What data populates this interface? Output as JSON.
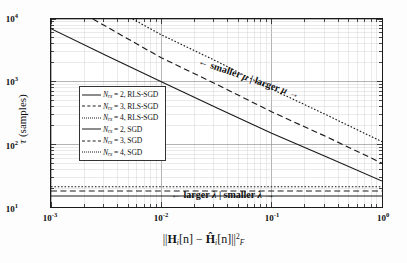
{
  "chart_data": {
    "type": "line",
    "title": "",
    "xlabel": "||H_i[n] - Ĥ_i[n]||^2_F",
    "ylabel": "τ (samples)",
    "xscale": "log",
    "yscale": "log",
    "xlim": [
      0.001,
      1.0
    ],
    "ylim": [
      10,
      10000
    ],
    "xticks": [
      "10-3",
      "10-2",
      "10-1",
      "100"
    ],
    "xtick_exponents": [
      "-3",
      "-2",
      "-1",
      "0"
    ],
    "ytick_exponents": [
      "4",
      "3",
      "2",
      "1"
    ],
    "grid": true,
    "legend_position": "center-left",
    "annotations": [
      {
        "id": "mu-annotation",
        "text": "← smaller μ | larger μ →",
        "rotation": 19
      },
      {
        "id": "lambda-annotation",
        "text": "← larger λ | smaller λ →",
        "rotation": 0
      }
    ],
    "series": [
      {
        "name": "Nrx = 2, RLS-SGD",
        "style": "solid",
        "x": [
          0.001,
          0.01,
          0.1,
          1.0
        ],
        "y": [
          15,
          15,
          15,
          15
        ]
      },
      {
        "name": "Nrx = 3, RLS-SGD",
        "style": "dashed",
        "x": [
          0.001,
          0.01,
          0.1,
          1.0
        ],
        "y": [
          18,
          18,
          18,
          18
        ]
      },
      {
        "name": "Nrx = 4, RLS-SGD",
        "style": "dotted",
        "x": [
          0.001,
          0.01,
          0.1,
          1.0
        ],
        "y": [
          21,
          21,
          21,
          21
        ]
      },
      {
        "name": "Nrx = 2, SGD",
        "style": "solid",
        "x": [
          0.001,
          0.0032,
          0.01,
          0.032,
          0.1,
          0.32,
          1.0
        ],
        "y": [
          7000,
          2600,
          1000,
          380,
          150,
          62,
          26
        ]
      },
      {
        "name": "Nrx = 3, SGD",
        "style": "dashed",
        "x": [
          0.0024,
          0.01,
          0.032,
          0.1,
          0.32,
          1.0
        ],
        "y": [
          10000,
          2400,
          900,
          330,
          130,
          50
        ]
      },
      {
        "name": "Nrx = 4, SGD",
        "style": "dotted",
        "x": [
          0.0055,
          0.01,
          0.032,
          0.1,
          0.32,
          1.0
        ],
        "y": [
          10000,
          5600,
          2100,
          760,
          290,
          110
        ]
      }
    ]
  },
  "axis": {
    "ylabel_tau": "τ",
    "ylabel_unit": "(samples)",
    "xlabel_norm_open": "||",
    "xlabel_H": "H",
    "xlabel_i": "i",
    "xlabel_n": "[n]",
    "xlabel_minus": "−",
    "xlabel_Hhat": "Ĥ",
    "xlabel_close": "||",
    "xlabel_pow": "2",
    "xlabel_F": "F"
  },
  "legend": {
    "items": [
      {
        "label_prefix": "N",
        "label_sub": "rx",
        "label_rest": " = 2, RLS-SGD",
        "style": "solid"
      },
      {
        "label_prefix": "N",
        "label_sub": "rx",
        "label_rest": " = 3, RLS-SGD",
        "style": "dashed"
      },
      {
        "label_prefix": "N",
        "label_sub": "rx",
        "label_rest": " = 4, RLS-SGD",
        "style": "dotted"
      },
      {
        "label_prefix": "N",
        "label_sub": "rx",
        "label_rest": " = 2, SGD",
        "style": "solid"
      },
      {
        "label_prefix": "N",
        "label_sub": "rx",
        "label_rest": " = 3, SGD",
        "style": "dashed"
      },
      {
        "label_prefix": "N",
        "label_sub": "rx",
        "label_rest": " = 4, SGD",
        "style": "dotted"
      }
    ]
  },
  "annotations": {
    "mu": "← smaller μ | larger μ →",
    "lambda": "← larger λ | smaller λ →"
  },
  "colors": {
    "line": "#1a1a1a",
    "grid_major": "#9a9a9a",
    "grid_minor": "#d0d0d0",
    "background": "#ffffff"
  }
}
